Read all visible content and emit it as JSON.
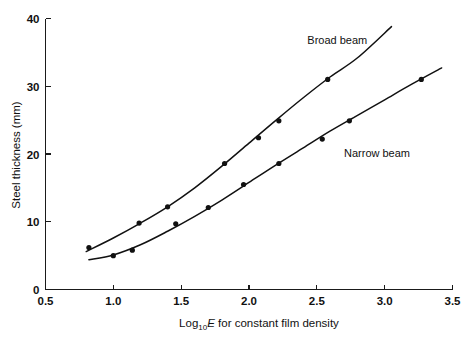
{
  "chart_data": {
    "type": "scatter",
    "title": "",
    "xlabel": "Log10E for constant film density",
    "xlabel_parts": {
      "prefix": "Log",
      "subscript": "10",
      "italic": "E",
      "suffix": " for constant film density"
    },
    "ylabel": "Steel thickness (mm)",
    "xlim": [
      0.5,
      3.5
    ],
    "ylim": [
      0,
      40
    ],
    "xticks": [
      "0.5",
      "1.0",
      "1.5",
      "2.0",
      "2.5",
      "3.0",
      "3.5"
    ],
    "xtick_values": [
      0.5,
      1.0,
      1.5,
      2.0,
      2.5,
      3.0,
      3.5
    ],
    "yticks": [
      "0",
      "10",
      "20",
      "30",
      "40"
    ],
    "ytick_values": [
      0,
      10,
      20,
      30,
      40
    ],
    "grid": false,
    "legend_position": "inline-annotation",
    "series": [
      {
        "name": "Broad beam",
        "label_x": 2.43,
        "label_y": 36.3,
        "marker": "filled-circle",
        "points": [
          {
            "x": 0.82,
            "y": 6.2
          },
          {
            "x": 1.19,
            "y": 9.8
          },
          {
            "x": 1.4,
            "y": 12.2
          },
          {
            "x": 1.82,
            "y": 18.6
          },
          {
            "x": 2.07,
            "y": 22.4
          },
          {
            "x": 2.22,
            "y": 24.9
          },
          {
            "x": 2.58,
            "y": 31.0
          }
        ],
        "fit_curve": [
          {
            "x": 0.8,
            "y": 5.6
          },
          {
            "x": 1.0,
            "y": 7.6
          },
          {
            "x": 1.2,
            "y": 9.8
          },
          {
            "x": 1.4,
            "y": 12.2
          },
          {
            "x": 1.6,
            "y": 15.0
          },
          {
            "x": 1.8,
            "y": 18.2
          },
          {
            "x": 2.0,
            "y": 21.6
          },
          {
            "x": 2.2,
            "y": 25.0
          },
          {
            "x": 2.4,
            "y": 28.3
          },
          {
            "x": 2.6,
            "y": 31.4
          },
          {
            "x": 2.8,
            "y": 34.2
          },
          {
            "x": 3.05,
            "y": 38.8
          }
        ]
      },
      {
        "name": "Narrow beam",
        "label_x": 2.7,
        "label_y": 19.6,
        "marker": "filled-circle",
        "points": [
          {
            "x": 1.0,
            "y": 5.0
          },
          {
            "x": 1.14,
            "y": 5.8
          },
          {
            "x": 1.46,
            "y": 9.7
          },
          {
            "x": 1.7,
            "y": 12.1
          },
          {
            "x": 1.96,
            "y": 15.5
          },
          {
            "x": 2.22,
            "y": 18.6
          },
          {
            "x": 2.54,
            "y": 22.2
          },
          {
            "x": 2.74,
            "y": 24.9
          },
          {
            "x": 3.27,
            "y": 31.0
          }
        ],
        "fit_curve": [
          {
            "x": 0.82,
            "y": 4.4
          },
          {
            "x": 1.0,
            "y": 5.1
          },
          {
            "x": 1.2,
            "y": 6.6
          },
          {
            "x": 1.4,
            "y": 8.6
          },
          {
            "x": 1.6,
            "y": 10.8
          },
          {
            "x": 1.8,
            "y": 13.2
          },
          {
            "x": 2.0,
            "y": 15.8
          },
          {
            "x": 2.2,
            "y": 18.4
          },
          {
            "x": 2.4,
            "y": 20.9
          },
          {
            "x": 2.6,
            "y": 23.4
          },
          {
            "x": 2.8,
            "y": 25.7
          },
          {
            "x": 3.0,
            "y": 28.0
          },
          {
            "x": 3.2,
            "y": 30.3
          },
          {
            "x": 3.42,
            "y": 32.7
          }
        ]
      }
    ]
  }
}
